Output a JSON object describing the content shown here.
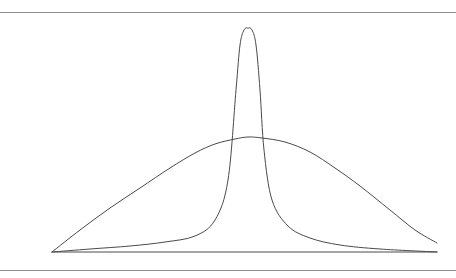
{
  "figure": {
    "background_color": "#ffffff",
    "line_color": "#4a4a4a",
    "rule_color": "#8f8f8f",
    "top_rule_y": 12,
    "bottom_rule_y": 270,
    "title": "",
    "caption": ""
  },
  "chart_data": {
    "type": "line",
    "title": "",
    "subtitle": "",
    "xlabel": "",
    "ylabel": "",
    "xlim": [
      52,
      437
    ],
    "ylim": [
      252,
      28
    ],
    "grid": false,
    "legend": "none",
    "axis": {
      "baseline_y": 252,
      "baseline_x_start": 52,
      "baseline_x_end": 437,
      "tick_labels_x": [],
      "tick_labels_y": []
    },
    "annotations": [],
    "series": [
      {
        "name": "leptokurtic-narrow-peak",
        "description": "tall narrow peaked distribution with long flat tails",
        "peak_x": 248,
        "peak_y": 28,
        "x": [
          52,
          90,
          130,
          165,
          195,
          215,
          228,
          236,
          240,
          244,
          248,
          252,
          256,
          260,
          264,
          272,
          288,
          310,
          340,
          380,
          437
        ],
        "y": [
          252,
          249,
          246,
          242,
          236,
          220,
          180,
          90,
          45,
          30,
          28,
          30,
          45,
          90,
          150,
          200,
          226,
          238,
          245,
          249,
          252
        ]
      },
      {
        "name": "platykurtic-broad-flat",
        "description": "broad low flat-topped distribution",
        "peak_x": 248,
        "peak_y": 137,
        "x": [
          52,
          80,
          110,
          140,
          170,
          195,
          215,
          235,
          248,
          262,
          285,
          310,
          335,
          360,
          390,
          415,
          437
        ],
        "y": [
          252,
          230,
          208,
          188,
          168,
          153,
          144,
          139,
          137,
          138,
          142,
          152,
          168,
          186,
          210,
          230,
          243
        ]
      }
    ]
  }
}
